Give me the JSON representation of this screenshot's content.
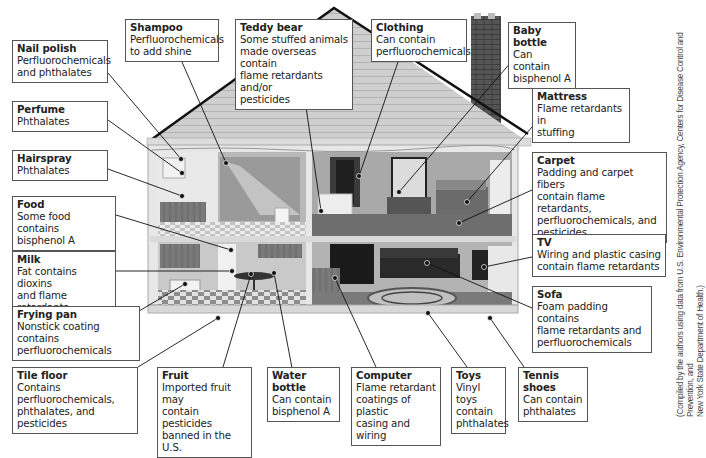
{
  "diagram": {
    "callouts": [
      {
        "id": "nail-polish",
        "title": "Nail polish",
        "text": "Perfluorochemicals\nand phthalates"
      },
      {
        "id": "shampoo",
        "title": "Shampoo",
        "text": "Perfluorochemicals\nto add shine"
      },
      {
        "id": "teddy-bear",
        "title": "Teddy bear",
        "text": "Some stuffed animals\nmade overseas contain\nflame retardants and/or\npesticides"
      },
      {
        "id": "clothing",
        "title": "Clothing",
        "text": "Can contain\nperfluorochemicals"
      },
      {
        "id": "baby-bottle",
        "title": "Baby bottle",
        "text": "Can contain\nbisphenol A"
      },
      {
        "id": "perfume",
        "title": "Perfume",
        "text": "Phthalates"
      },
      {
        "id": "mattress",
        "title": "Mattress",
        "text": "Flame retardants in\nstuffing"
      },
      {
        "id": "hairspray",
        "title": "Hairspray",
        "text": "Phthalates"
      },
      {
        "id": "carpet",
        "title": "Carpet",
        "text": "Padding and carpet fibers\ncontain flame retardants,\nperfluorochemicals, and\npesticides"
      },
      {
        "id": "food",
        "title": "Food",
        "text": "Some food contains\nbisphenol A"
      },
      {
        "id": "milk",
        "title": "Milk",
        "text": "Fat contains dioxins\nand flame retardants"
      },
      {
        "id": "tv",
        "title": "TV",
        "text": "Wiring and plastic casing\ncontain flame retardants"
      },
      {
        "id": "frying-pan",
        "title": "Frying pan",
        "text": "Nonstick coating contains\nperfluorochemicals"
      },
      {
        "id": "sofa",
        "title": "Sofa",
        "text": "Foam padding contains\nflame retardants and\nperfluorochemicals"
      },
      {
        "id": "tile-floor",
        "title": "Tile floor",
        "text": "Contains\nperfluorochemicals,\nphthalates, and pesticides"
      },
      {
        "id": "fruit",
        "title": "Fruit",
        "text": "Imported fruit may\ncontain pesticides\nbanned in the U.S."
      },
      {
        "id": "water-bottle",
        "title": "Water bottle",
        "text": "Can contain\nbisphenol A"
      },
      {
        "id": "computer",
        "title": "Computer",
        "text": "Flame retardant\ncoatings of plastic\ncasing and wiring"
      },
      {
        "id": "toys",
        "title": "Toys",
        "text": "Vinyl toys\ncontain\nphthalates"
      },
      {
        "id": "tennis-shoes",
        "title": "Tennis shoes",
        "text": "Can contain\nphthalates"
      }
    ],
    "credit": "(Compiled by the authors using data from U.S. Environmental Protection Agency, Centers for Disease Control and Prevention, and\nNew York State Department of Health.)"
  }
}
